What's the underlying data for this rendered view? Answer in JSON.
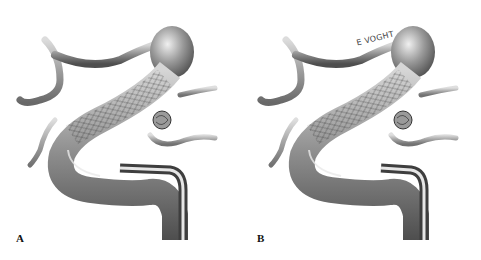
{
  "figure": {
    "panels": [
      {
        "label": "A",
        "description": "Stent deployed across aneurysm neck in curved parent artery, coils visible within aneurysm through stent mesh",
        "stent_mesh_visible_in_aneurysm": true
      },
      {
        "label": "B",
        "description": "Stent deployed across aneurysm neck with coiled aneurysm, microcatheter withdrawn",
        "signature": "E VOGHT"
      }
    ],
    "colors": {
      "background": "#ffffff",
      "vessel_dark": "#5a5a5a",
      "vessel_mid": "#8c8c8c",
      "vessel_light": "#d8d8d8",
      "label": "#111111"
    }
  }
}
